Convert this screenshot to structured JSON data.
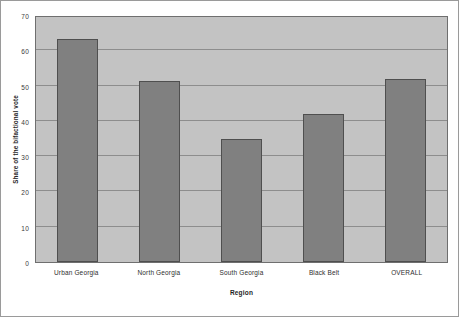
{
  "chart_data": {
    "type": "bar",
    "title": "",
    "xlabel": "Region",
    "ylabel": "Share of the bifactional vote",
    "categories": [
      "Urban Georgia",
      "North Georgia",
      "South Georgia",
      "Black Belt",
      "OVERALL"
    ],
    "values": [
      63.3,
      51.3,
      35.0,
      42.0,
      52.0
    ],
    "ylim": [
      0,
      70
    ],
    "yticks": [
      0,
      10,
      20,
      30,
      40,
      50,
      60,
      70
    ],
    "ytick_labels": [
      "0",
      "10",
      "20",
      "30",
      "40",
      "50",
      "60",
      "70"
    ],
    "grid": true,
    "legend": false,
    "colors": {
      "bar_fill": "#808080",
      "bar_border": "#4f4f4f",
      "plot_background": "#c3c3c3",
      "gridline": "#8d8d8d",
      "figure_background": "#ffffff",
      "frame_border": "#9a9a9a",
      "text": "#2e2e2e"
    }
  }
}
